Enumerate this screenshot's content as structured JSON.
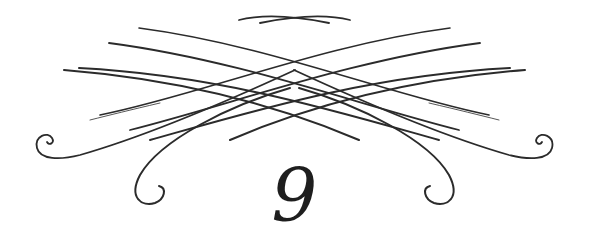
{
  "ornament": {
    "name": "flourish-divider",
    "stroke_color": "#2b2b2b"
  },
  "chapter": {
    "number": "9"
  }
}
